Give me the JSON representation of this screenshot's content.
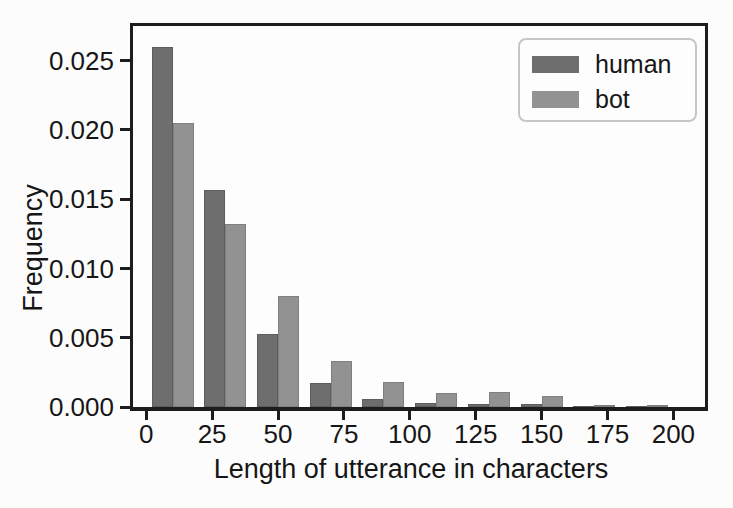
{
  "figure": {
    "background": "#fcfcfc",
    "ink_color": "#1d1d1d",
    "text_color": "#161616"
  },
  "chart_data": {
    "type": "bar",
    "subtype": "grouped-histogram",
    "title": "",
    "xlabel": "Length of utterance in characters",
    "ylabel": "Frequency",
    "bin_centers": [
      10,
      30,
      50,
      70,
      90,
      110,
      130,
      150,
      170,
      190
    ],
    "bin_width": 20,
    "bar_width_units": 8,
    "series": [
      {
        "name": "human",
        "color": "#6e6e6e",
        "values": [
          0.026,
          0.0157,
          0.0053,
          0.0017,
          0.0006,
          0.0003,
          0.0002,
          0.0002,
          5e-05,
          5e-05
        ]
      },
      {
        "name": "bot",
        "color": "#929292",
        "values": [
          0.0205,
          0.0132,
          0.008,
          0.0033,
          0.0018,
          0.001,
          0.0011,
          0.0008,
          0.00015,
          0.00015
        ]
      }
    ],
    "xlim": [
      -5,
      212
    ],
    "ylim": [
      0,
      0.0275
    ],
    "xticks": {
      "values": [
        0,
        25,
        50,
        75,
        100,
        125,
        150,
        175,
        200
      ],
      "labels": [
        "0",
        "25",
        "50",
        "75",
        "100",
        "125",
        "150",
        "175",
        "200"
      ]
    },
    "yticks": {
      "values": [
        0.0,
        0.005,
        0.01,
        0.015,
        0.02,
        0.025
      ],
      "labels": [
        "0.000",
        "0.005",
        "0.010",
        "0.015",
        "0.020",
        "0.025"
      ]
    },
    "legend": {
      "position": "upper-right",
      "entries": [
        "human",
        "bot"
      ]
    },
    "grid": false
  }
}
